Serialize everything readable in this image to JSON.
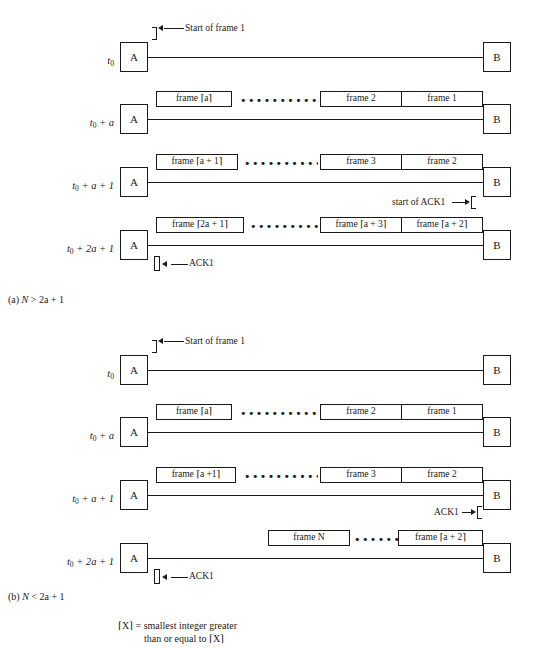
{
  "figure": {
    "nodes": {
      "sender": "A",
      "receiver": "B"
    },
    "notation": {
      "ceil_open": "⌈",
      "ceil_close": "⌉",
      "dots_long": "•••••••••••••••••",
      "dots_short": "••••••"
    },
    "part_a": {
      "caption_prefix": "(a) ",
      "caption_var": "N",
      "caption_rest": " > 2a + 1",
      "rows": [
        {
          "time_t": "t",
          "time_sub": "0",
          "time_rest": "",
          "annotation": "Start of frame 1",
          "frames_left": [],
          "frames_right": [],
          "dots": ""
        },
        {
          "time_t": "t",
          "time_sub": "0",
          "time_rest": " + a",
          "annotation": "",
          "frames_left": [
            "frame ⌈a⌉"
          ],
          "frames_right": [
            "frame 2",
            "frame 1"
          ],
          "dots": "•••••••••••••••••"
        },
        {
          "time_t": "t",
          "time_sub": "0",
          "time_rest": " + a + 1",
          "annotation": "start of ACK1",
          "frames_left": [
            "frame ⌈a + 1⌉"
          ],
          "frames_right": [
            "frame 3",
            "frame 2"
          ],
          "dots": "•••••••••••••••••"
        },
        {
          "time_t": "t",
          "time_sub": "0",
          "time_rest": " + 2a + 1",
          "annotation": "ACK1",
          "frames_left": [
            "frame ⌈2a + 1⌉"
          ],
          "frames_right": [
            "frame ⌈a + 3⌉",
            "frame ⌈a + 2⌉"
          ],
          "dots": "•••••••••••••••••"
        }
      ]
    },
    "part_b": {
      "caption_prefix": "(b) ",
      "caption_var": "N",
      "caption_rest": " < 2a + 1",
      "rows": [
        {
          "time_t": "t",
          "time_sub": "0",
          "time_rest": "",
          "annotation": "Start of frame 1",
          "frames_left": [],
          "frames_right": [],
          "dots": ""
        },
        {
          "time_t": "t",
          "time_sub": "0",
          "time_rest": " + a",
          "annotation": "",
          "frames_left": [
            "frame ⌈a⌉"
          ],
          "frames_right": [
            "frame 2",
            "frame 1"
          ],
          "dots": "•••••••••••••••••"
        },
        {
          "time_t": "t",
          "time_sub": "0",
          "time_rest": " + a + 1",
          "annotation": "ACK1",
          "frames_left": [
            "frame ⌈a +1⌉"
          ],
          "frames_right": [
            "frame 3",
            "frame 2"
          ],
          "dots": "•••••••••••••••••"
        },
        {
          "time_t": "t",
          "time_sub": "0",
          "time_rest": " + 2a + 1",
          "annotation": "ACK1",
          "frames_left": [],
          "frames_right": [
            "frame N",
            "frame ⌈a + 2⌉"
          ],
          "dots": "••••••"
        }
      ]
    },
    "legend": {
      "line1": "⌈X⌉ = smallest integer greater",
      "line2": "than or equal to ⌈X⌉"
    }
  }
}
